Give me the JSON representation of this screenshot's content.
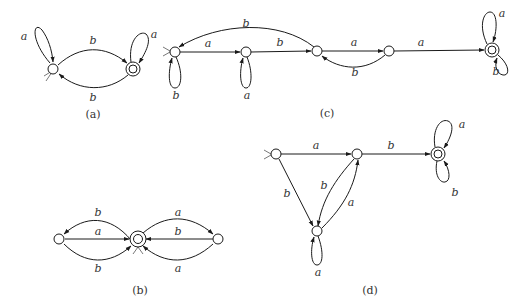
{
  "figure": {
    "panels": [
      {
        "id": "a",
        "caption": "(a)",
        "states": [
          {
            "id": "q0",
            "initial": true,
            "final": false
          },
          {
            "id": "q1",
            "initial": false,
            "final": true
          }
        ],
        "transitions": [
          {
            "from": "q0",
            "to": "q0",
            "label": "a"
          },
          {
            "from": "q0",
            "to": "q1",
            "label": "b"
          },
          {
            "from": "q1",
            "to": "q0",
            "label": "b"
          },
          {
            "from": "q1",
            "to": "q1",
            "label": "a"
          }
        ]
      },
      {
        "id": "b",
        "caption": "(b)",
        "states": [
          {
            "id": "L",
            "initial": false,
            "final": false
          },
          {
            "id": "C",
            "initial": true,
            "final": true
          },
          {
            "id": "R",
            "initial": false,
            "final": false
          }
        ],
        "transitions": [
          {
            "from": "C",
            "to": "L",
            "label": "b"
          },
          {
            "from": "L",
            "to": "C",
            "label": "a"
          },
          {
            "from": "L",
            "to": "C",
            "label": "b"
          },
          {
            "from": "C",
            "to": "R",
            "label": "a"
          },
          {
            "from": "R",
            "to": "C",
            "label": "b"
          },
          {
            "from": "R",
            "to": "C",
            "label": "a"
          }
        ]
      },
      {
        "id": "c",
        "caption": "(c)",
        "states": [
          {
            "id": "p0",
            "initial": true,
            "final": false
          },
          {
            "id": "p1",
            "initial": false,
            "final": false
          },
          {
            "id": "p2",
            "initial": false,
            "final": false
          },
          {
            "id": "p3",
            "initial": false,
            "final": false
          },
          {
            "id": "p4",
            "initial": false,
            "final": true
          }
        ],
        "transitions": [
          {
            "from": "p0",
            "to": "p0",
            "label": "b"
          },
          {
            "from": "p0",
            "to": "p1",
            "label": "a"
          },
          {
            "from": "p1",
            "to": "p1",
            "label": "a"
          },
          {
            "from": "p1",
            "to": "p2",
            "label": "b"
          },
          {
            "from": "p2",
            "to": "p0",
            "label": "b"
          },
          {
            "from": "p2",
            "to": "p3",
            "label": "a"
          },
          {
            "from": "p3",
            "to": "p2",
            "label": "b"
          },
          {
            "from": "p3",
            "to": "p4",
            "label": "a"
          },
          {
            "from": "p4",
            "to": "p4",
            "label": "a"
          },
          {
            "from": "p4",
            "to": "p4",
            "label": "b"
          }
        ]
      },
      {
        "id": "d",
        "caption": "(d)",
        "states": [
          {
            "id": "r0",
            "initial": true,
            "final": false
          },
          {
            "id": "r1",
            "initial": false,
            "final": false
          },
          {
            "id": "r2",
            "initial": false,
            "final": false
          },
          {
            "id": "r3",
            "initial": false,
            "final": true
          }
        ],
        "transitions": [
          {
            "from": "r0",
            "to": "r1",
            "label": "a"
          },
          {
            "from": "r0",
            "to": "r2",
            "label": "b"
          },
          {
            "from": "r1",
            "to": "r2",
            "label": "b"
          },
          {
            "from": "r2",
            "to": "r1",
            "label": "a"
          },
          {
            "from": "r2",
            "to": "r2",
            "label": "a"
          },
          {
            "from": "r1",
            "to": "r3",
            "label": "b"
          },
          {
            "from": "r3",
            "to": "r3",
            "label": "a"
          },
          {
            "from": "r3",
            "to": "r3",
            "label": "b"
          }
        ]
      }
    ]
  },
  "labels": {
    "a": {
      "loop_q0": "a",
      "q0_q1": "b",
      "q1_q0": "b",
      "loop_q1": "a",
      "caption": "(a)"
    },
    "b": {
      "c_l_top": "b",
      "l_c_mid": "a",
      "l_c_bot": "b",
      "c_r_top": "a",
      "r_c_mid": "b",
      "r_c_bot": "a",
      "caption": "(b)"
    },
    "c": {
      "loop_p0": "b",
      "p0_p1": "a",
      "loop_p1": "a",
      "p1_p2": "b",
      "p2_p0": "b",
      "p2_p3": "a",
      "p3_p2": "b",
      "p3_p4": "a",
      "loop_p4_a": "a",
      "loop_p4_b": "b",
      "caption": "(c)"
    },
    "d": {
      "r0_r1": "a",
      "r0_r2": "b",
      "r1_r2": "b",
      "r2_r1": "a",
      "loop_r2": "a",
      "r1_r3": "b",
      "loop_r3_a": "a",
      "loop_r3_b": "b",
      "caption": "(d)"
    }
  }
}
